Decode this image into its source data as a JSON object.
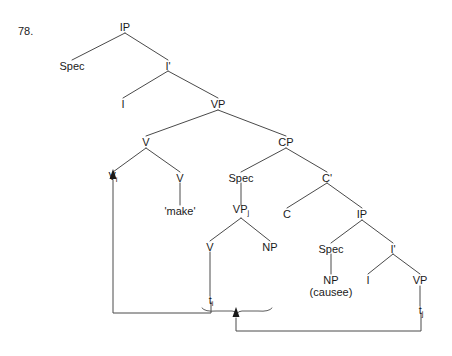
{
  "figure": {
    "example_number": "78.",
    "type": "syntactic-tree-diagram"
  },
  "nodes": {
    "ip_root": "IP",
    "spec_top": "Spec",
    "ibar_top": "I'",
    "i_top": "I",
    "vp_top": "VP",
    "v_mid": "V",
    "cp": "CP",
    "v_head": "V",
    "v_head_sub": "i",
    "v_make": "V",
    "make_word": "'make'",
    "spec_cp": "Spec",
    "cbar": "C'",
    "vp_moved": "VP",
    "vp_moved_sub": "j",
    "c_head": "C",
    "ip_lower": "IP",
    "v_lower": "V",
    "np_obj": "NP",
    "spec_ip_lower": "Spec",
    "ibar_lower": "I'",
    "trace_i": "t",
    "trace_i_sub": "i",
    "np_causee": "NP",
    "np_causee_gloss": "(causee)",
    "i_lower": "I",
    "vp_lower": "VP",
    "trace_j": "t",
    "trace_j_sub": "j"
  },
  "movement": {
    "arrow_1_label": "V-movement: t-i to V-i",
    "arrow_2_label": "VP-movement: t-j to Spec-CP"
  },
  "colors": {
    "ink": "#1a1a1a",
    "line": "#4a4a4a",
    "background": "#ffffff"
  }
}
